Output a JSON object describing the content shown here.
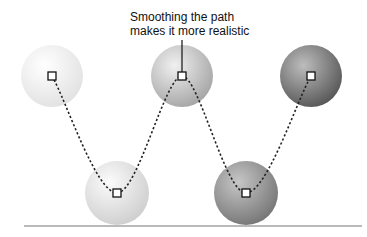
{
  "caption": {
    "line1": "Smoothing the path",
    "line2": "makes it more realistic"
  },
  "balls": [
    {
      "cx": 52,
      "cy": 76,
      "r": 31,
      "fill_light": "#ffffff",
      "fill_dark": "#e4e4e4"
    },
    {
      "cx": 117,
      "cy": 193,
      "r": 32,
      "fill_light": "#fbfbfb",
      "fill_dark": "#d2d2d2"
    },
    {
      "cx": 182,
      "cy": 76,
      "r": 31,
      "fill_light": "#efefef",
      "fill_dark": "#a9a9a9"
    },
    {
      "cx": 246,
      "cy": 193,
      "r": 32,
      "fill_light": "#c4c4c4",
      "fill_dark": "#7c7c7c"
    },
    {
      "cx": 311,
      "cy": 76,
      "r": 31,
      "fill_light": "#b9b9b9",
      "fill_dark": "#5e5e5e"
    }
  ],
  "path_points": [
    [
      52,
      76
    ],
    [
      117,
      193
    ],
    [
      182,
      76
    ],
    [
      246,
      193
    ],
    [
      311,
      76
    ]
  ],
  "ground": {
    "x1": 24,
    "x2": 362,
    "y": 226,
    "color": "#777777"
  },
  "colors": {
    "path": "#222222",
    "marker_fill": "#ffffff",
    "marker_stroke": "#111111",
    "leader": "#111111"
  }
}
